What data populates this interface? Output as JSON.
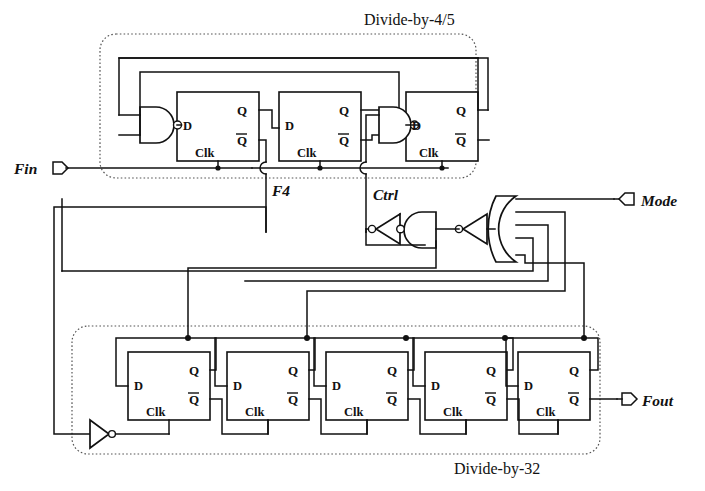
{
  "diagram": {
    "blocks": [
      {
        "id": "div45",
        "label": "Divide-by-4/5",
        "flipflop_count": 3
      },
      {
        "id": "div32",
        "label": "Divide-by-32",
        "flipflop_count": 5
      }
    ],
    "ports": [
      {
        "name": "Fin",
        "label": "Fin",
        "direction": "input",
        "marker": "port-arrow-right"
      },
      {
        "name": "Mode",
        "label": "Mode",
        "direction": "input",
        "marker": "port-arrow-left"
      },
      {
        "name": "Fout",
        "label": "Fout",
        "direction": "output",
        "marker": "port-arrow-right"
      }
    ],
    "signals": [
      {
        "name": "F4",
        "label": "F4",
        "source": "div45.ff1.Clk-tap"
      },
      {
        "name": "Ctrl",
        "label": "Ctrl",
        "source": "div45.nand2.input-tap"
      }
    ],
    "pin_labels": {
      "d": "D",
      "q": "Q",
      "qbar": "Q",
      "clk": "Clk"
    },
    "gates": [
      {
        "id": "nand1",
        "type": "nand",
        "inputs": 2,
        "orientation": "right",
        "block": "div45"
      },
      {
        "id": "nand2",
        "type": "nand",
        "inputs": 2,
        "orientation": "right",
        "block": "div45"
      },
      {
        "id": "inv-a",
        "type": "inverter",
        "orientation": "left",
        "block": "mode-logic"
      },
      {
        "id": "nand3",
        "type": "nand",
        "inputs": 2,
        "orientation": "left",
        "block": "mode-logic"
      },
      {
        "id": "inv-b",
        "type": "inverter",
        "orientation": "left",
        "block": "mode-logic"
      },
      {
        "id": "or5",
        "type": "or",
        "inputs": 5,
        "orientation": "left",
        "block": "mode-logic"
      },
      {
        "id": "inv-clk",
        "type": "inverter",
        "orientation": "right",
        "block": "div32"
      }
    ],
    "colors": {
      "ink": "#111111",
      "paper": "#ffffff",
      "dashed_box": "#555555"
    }
  }
}
